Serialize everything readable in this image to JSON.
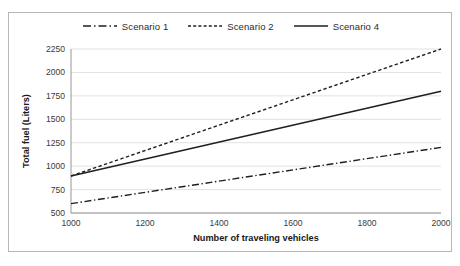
{
  "chart_data": {
    "type": "line",
    "title": "",
    "xlabel": "Number of traveling vehicles",
    "ylabel": "Total fuel (Liters)",
    "xlim": [
      1000,
      2000
    ],
    "ylim": [
      500,
      2250
    ],
    "xticks": [
      1000,
      1200,
      1400,
      1600,
      1800,
      2000
    ],
    "yticks": [
      500,
      750,
      1000,
      1250,
      1500,
      1750,
      2000,
      2250
    ],
    "grid": "horizontal",
    "legend_position": "top-center",
    "x": [
      1000,
      2000
    ],
    "series": [
      {
        "name": "Scenario 1",
        "style": "dash-dot",
        "color": "#1f1f1f",
        "values": [
          600,
          1200
        ]
      },
      {
        "name": "Scenario 2",
        "style": "dashed",
        "color": "#1f1f1f",
        "values": [
          895,
          2250
        ]
      },
      {
        "name": "Scenario 4",
        "style": "solid",
        "color": "#1f1f1f",
        "values": [
          895,
          1800
        ]
      }
    ]
  },
  "legend": {
    "entries": [
      {
        "label": "Scenario 1",
        "icon": "dash-dot-line-icon"
      },
      {
        "label": "Scenario 2",
        "icon": "dashed-line-icon"
      },
      {
        "label": "Scenario 4",
        "icon": "solid-line-icon"
      }
    ]
  },
  "axes": {
    "y_title": "Total fuel (Liters)",
    "x_title": "Number of traveling vehicles",
    "y_tick_labels": [
      "2250",
      "2000",
      "1750",
      "1500",
      "1250",
      "1000",
      "750",
      "500"
    ],
    "x_tick_labels": [
      "1000",
      "1200",
      "1400",
      "1600",
      "1800",
      "2000"
    ]
  }
}
